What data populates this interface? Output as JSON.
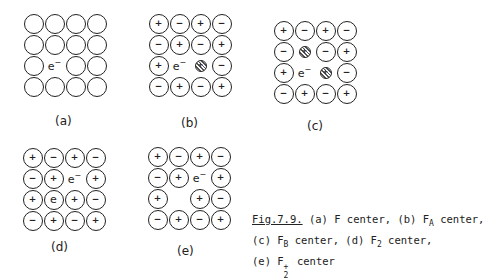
{
  "panels": [
    {
      "id": "a",
      "label": "(a)",
      "description": "F center",
      "grid": [
        [
          "o",
          "o",
          "o",
          "o"
        ],
        [
          "o",
          "o",
          "o",
          "o"
        ],
        [
          "o",
          "e",
          "o",
          "o"
        ],
        [
          "o",
          "o",
          "o",
          "o"
        ]
      ]
    },
    {
      "id": "b",
      "label": "(b)",
      "description": "FA center",
      "grid": [
        [
          "+",
          "-",
          "+",
          "-"
        ],
        [
          "-",
          "+",
          "-",
          "+"
        ],
        [
          "+",
          "e",
          "A+",
          "-"
        ],
        [
          "-",
          "+",
          "-",
          "+"
        ]
      ]
    },
    {
      "id": "c",
      "label": "(c)",
      "description": "FB center",
      "grid": [
        [
          "+",
          "-",
          "+",
          "-"
        ],
        [
          "-",
          "A+",
          "-",
          "+"
        ],
        [
          "+",
          "e",
          "A+",
          "-"
        ],
        [
          "-",
          "+",
          "-",
          "+"
        ]
      ]
    },
    {
      "id": "d",
      "label": "(d)",
      "description": "F2 center",
      "grid": [
        [
          "+",
          "-",
          "+",
          "-"
        ],
        [
          "-",
          "+",
          "e",
          "+"
        ],
        [
          "+",
          "e2",
          "+",
          "-"
        ],
        [
          "-",
          "+",
          "-",
          "+"
        ]
      ]
    },
    {
      "id": "e",
      "label": "(e)",
      "description": "F2+ center",
      "grid": [
        [
          "+",
          "-",
          "+",
          "-"
        ],
        [
          "-",
          "+",
          "e",
          "+"
        ],
        [
          "+",
          " ",
          "+",
          "-"
        ],
        [
          "-",
          "+",
          "-",
          "+"
        ]
      ]
    }
  ],
  "symbols": {
    "electron": "e",
    "electron_sup": "−",
    "plus": "+",
    "minus": "−"
  },
  "caption": {
    "fig_number": "Fig.7.9.",
    "line1_a": " (a) F center, (b) F",
    "line1_sub": "A",
    "line1_b": " center,",
    "line2_a": "(c) F",
    "line2_sub": "B",
    "line2_b": " center, (d) F",
    "line2_sub2": "2",
    "line2_c": " center,",
    "line3_a": "(e) F",
    "line3_sup": "+",
    "line3_sub": "2",
    "line3_b": " center"
  }
}
